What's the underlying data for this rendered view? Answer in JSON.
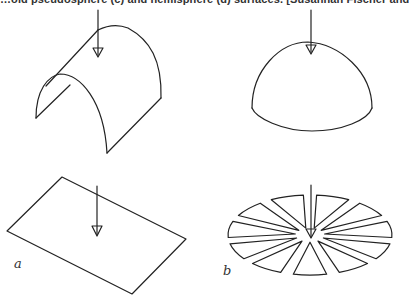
{
  "header": {
    "text": "…oid pseudosphere (c) and hemisphere (d) surfaces. [Susannah Fischer and Christopher K"
  },
  "panels": [
    {
      "id": "a",
      "label": "a",
      "top_shape": "half-cylinder",
      "bottom_shape": "flat-plane"
    },
    {
      "id": "b",
      "label": "b",
      "top_shape": "hemisphere",
      "bottom_shape": "flattened-hemisphere-with-gores"
    }
  ],
  "colors": {
    "stroke": "#222222",
    "background": "#ffffff",
    "text": "#333333"
  }
}
